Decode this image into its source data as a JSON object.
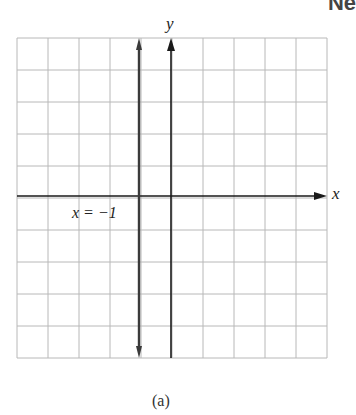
{
  "chart_data": {
    "type": "line",
    "title": "",
    "xlabel": "x",
    "ylabel": "y",
    "xlim": [
      -5,
      5
    ],
    "ylim": [
      -5,
      5
    ],
    "grid": true,
    "grid_columns": 10,
    "grid_rows": 10,
    "series": [
      {
        "name": "x = -1",
        "kind": "vertical-line",
        "x": -1,
        "y_range": [
          -5,
          5
        ],
        "arrows": "both"
      }
    ],
    "annotations": [
      {
        "text": "x = −1",
        "position": "left of line, just below x-axis"
      }
    ],
    "caption": "(a)"
  },
  "labels": {
    "x_axis": "x",
    "y_axis": "y",
    "line_label": "x = −1",
    "caption": "(a)",
    "corner_fragment": "Ne"
  },
  "colors": {
    "grid": "#b8b8b8",
    "axis": "#1a1a1a",
    "line": "#3a3a3a"
  }
}
